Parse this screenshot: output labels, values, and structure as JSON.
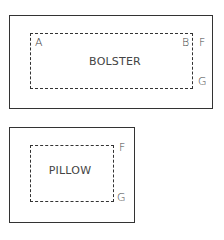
{
  "diagrams": [
    {
      "name": "bolster",
      "title": "BOLSTER",
      "labels": {
        "a": "A",
        "b": "B",
        "f": "F",
        "g": "G"
      }
    },
    {
      "name": "pillow",
      "title": "PILLOW",
      "labels": {
        "f": "F",
        "g": "G"
      }
    }
  ]
}
